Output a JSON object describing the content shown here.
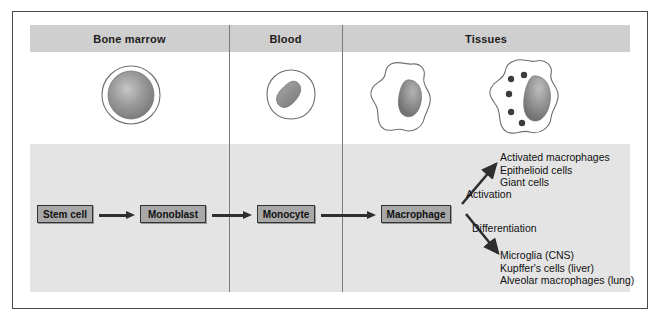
{
  "figure": {
    "colors": {
      "frame_border": "#4a4a4a",
      "header_band": "#cfcfcf",
      "lower_panel": "#e4e4e4",
      "box_fill": "#a8a8a8",
      "box_border": "#333333",
      "arrow": "#2e2e2e",
      "cell_outline": "#6e6e6e",
      "nucleus": "#8f8f8f",
      "granule": "#3c3c3c",
      "background": "#ffffff"
    }
  },
  "columns": [
    {
      "id": "bone-marrow",
      "label": "Bone marrow"
    },
    {
      "id": "blood",
      "label": "Blood"
    },
    {
      "id": "tissues",
      "label": "Tissues"
    }
  ],
  "cell_illustrations": [
    {
      "id": "stem-cell-illustration",
      "column": "bone-marrow",
      "shape": "round-cell-large-nucleus",
      "granules": 0
    },
    {
      "id": "monocyte-illustration",
      "column": "blood",
      "shape": "rounded-cell-bean-nucleus",
      "granules": 0
    },
    {
      "id": "macrophage-illustration",
      "column": "tissues",
      "shape": "amoeboid-cell-kidney-nucleus",
      "granules": 0
    },
    {
      "id": "activated-macrophage-illustration",
      "column": "tissues",
      "shape": "amoeboid-cell-granules",
      "granules": 5
    }
  ],
  "flow": {
    "stages": [
      {
        "id": "stem-cell",
        "label": "Stem cell",
        "column": "bone-marrow"
      },
      {
        "id": "monoblast",
        "label": "Monoblast",
        "column": "bone-marrow"
      },
      {
        "id": "monocyte",
        "label": "Monocyte",
        "column": "blood"
      },
      {
        "id": "macrophage",
        "label": "Macrophage",
        "column": "tissues"
      }
    ],
    "arrows": [
      "stem-cell-to-monoblast",
      "monoblast-to-monocyte",
      "monocyte-to-macrophage"
    ]
  },
  "branches": [
    {
      "id": "activation",
      "label": "Activation",
      "direction": "up-right",
      "outcomes": [
        "Activated macrophages",
        "Epithelioid cells",
        "Giant cells"
      ]
    },
    {
      "id": "differentiation",
      "label": "Differentiation",
      "direction": "down-right",
      "outcomes": [
        "Microglia (CNS)",
        "Kupffer's cells (liver)",
        "Alveolar macrophages (lung)"
      ]
    }
  ]
}
